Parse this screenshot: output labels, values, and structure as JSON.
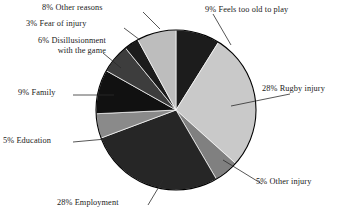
{
  "chart_data": {
    "type": "pie",
    "title": "",
    "subtitle": "",
    "xlabel": "",
    "ylabel": "",
    "legend_position": "callout-labels",
    "grid": false,
    "units": "percent",
    "total": 101,
    "start_angle_deg": 0,
    "direction": "clockwise",
    "categories": [
      "Feels too old to play",
      "Rugby injury",
      "Other injury",
      "Employment",
      "Education",
      "Family",
      "Disillusionment with the game",
      "Fear of injury",
      "Other reasons"
    ],
    "values": [
      9,
      28,
      5,
      28,
      5,
      9,
      6,
      3,
      8
    ],
    "slices": [
      {
        "label": "9% Feels too old to play",
        "name": "Feels too old to play",
        "value": 9,
        "color": "#1c1c1c"
      },
      {
        "label": "28% Rugby injury",
        "name": "Rugby injury",
        "value": 28,
        "color": "#c9c9c9"
      },
      {
        "label": "5% Other injury",
        "name": "Other injury",
        "value": 5,
        "color": "#808080"
      },
      {
        "label": "28% Employment",
        "name": "Employment",
        "value": 28,
        "color": "#262626"
      },
      {
        "label": "5% Education",
        "name": "Education",
        "value": 5,
        "color": "#8a8a8a"
      },
      {
        "label": "9% Family",
        "name": "Family",
        "value": 9,
        "color": "#111111"
      },
      {
        "label": "6% Disillusionment with the game",
        "name": "Disillusionment with the game",
        "value": 6,
        "color": "#3d3d3d"
      },
      {
        "label": "3% Fear of injury",
        "name": "Fear of injury",
        "value": 3,
        "color": "#1c1c1c"
      },
      {
        "label": "8% Other reasons",
        "name": "Other reasons",
        "value": 8,
        "color": "#bdbdbd"
      }
    ]
  },
  "labels": {
    "other_reasons": "8% Other reasons",
    "fear_of_injury": "3% Fear of injury",
    "disillusionment_line1": "6% Disillusionment",
    "disillusionment_line2": "with the game",
    "family": "9% Family",
    "education": "5% Education",
    "employment": "28% Employment",
    "other_injury": "5% Other injury",
    "rugby_injury": "28% Rugby injury",
    "feels_too_old": "9% Feels too old to play"
  },
  "colors": {
    "background": "#ffffff",
    "outline": "#000000",
    "text": "#1a1a1a",
    "leader_line": "#2b2b2b"
  }
}
